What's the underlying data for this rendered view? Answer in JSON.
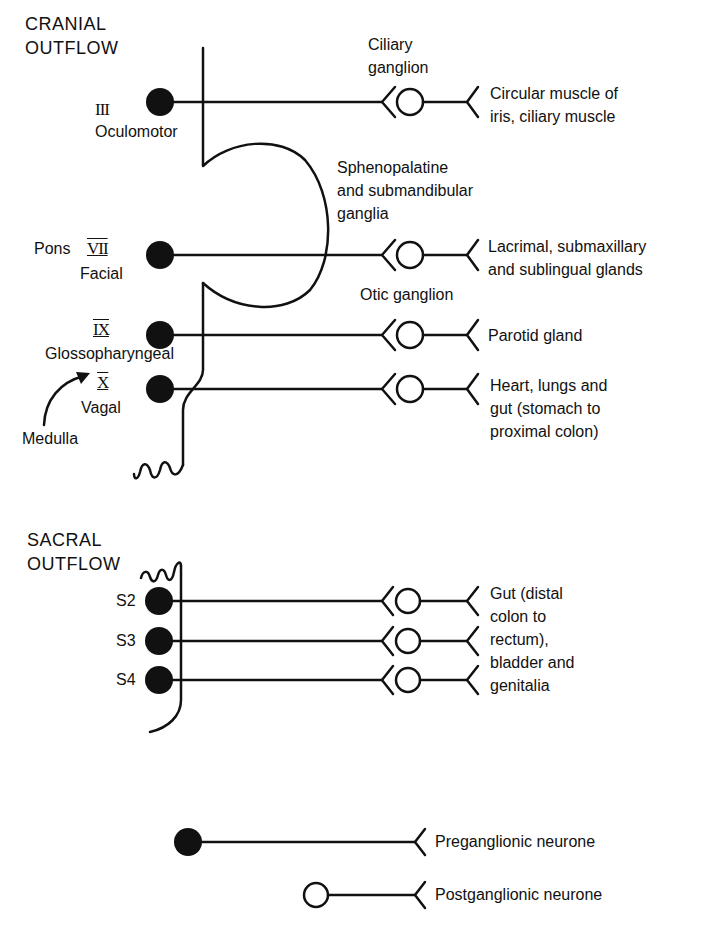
{
  "cranial": {
    "heading_line1": "CRANIAL",
    "heading_line2": "OUTFLOW",
    "nerves": [
      {
        "numeral": "III",
        "name": "Oculomotor"
      },
      {
        "numeral": "VII",
        "name": "Facial",
        "region": "Pons"
      },
      {
        "numeral": "IX",
        "name": "Glossopharyngeal"
      },
      {
        "numeral": "X",
        "name": "Vagal"
      }
    ],
    "region_medulla": "Medulla",
    "ganglia": {
      "ciliary": "Ciliary\nganglion",
      "sphenopalatine": "Sphenopalatine\nand submandibular\nganglia",
      "otic": "Otic ganglion"
    },
    "targets": [
      "Circular muscle of\niris, ciliary muscle",
      "Lacrimal, submaxillary\nand sublingual glands",
      "Parotid gland",
      "Heart, lungs and\ngut (stomach to\nproximal colon)"
    ]
  },
  "sacral": {
    "heading_line1": "SACRAL",
    "heading_line2": "OUTFLOW",
    "segments": [
      "S2",
      "S3",
      "S4"
    ],
    "target": "Gut (distal\ncolon to\nrectum),\nbladder and\ngenitalia"
  },
  "legend": {
    "preganglionic": "Preganglionic neurone",
    "postganglionic": "Postganglionic neurone"
  }
}
